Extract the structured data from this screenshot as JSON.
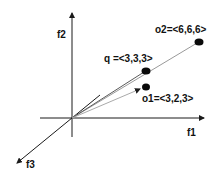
{
  "diagram": {
    "title": "",
    "axes": [
      {
        "id": "f1",
        "label": "f1"
      },
      {
        "id": "f2",
        "label": "f2"
      },
      {
        "id": "f3",
        "label": "f3"
      }
    ],
    "points": [
      {
        "id": "o2",
        "label": "o2=<6,6,6>",
        "coords": [
          6,
          6,
          6
        ]
      },
      {
        "id": "q",
        "label": "q =<3,3,3>",
        "coords": [
          3,
          3,
          3
        ]
      },
      {
        "id": "o1",
        "label": "o1=<3,2,3>",
        "coords": [
          3,
          2,
          3
        ]
      }
    ],
    "colors": {
      "axis": "#1a1a1a",
      "vector": "#9a9a9a",
      "point": "#0a0a0a",
      "background": "#ffffff"
    }
  }
}
